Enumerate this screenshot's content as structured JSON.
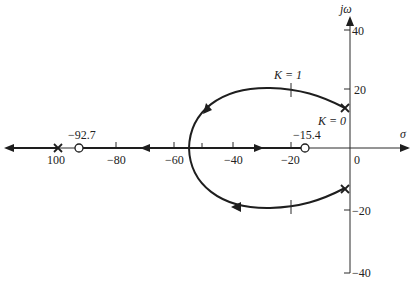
{
  "diagram": {
    "type": "root-locus",
    "axes": {
      "real_label": "σ",
      "imag_label": "jω",
      "real_ticks": [
        "100",
        "−80",
        "−60",
        "−40",
        "−20",
        "0"
      ],
      "imag_ticks": [
        "40",
        "20",
        "−20",
        "−40"
      ]
    },
    "poles": [
      {
        "label": "K = 0",
        "sigma": -2,
        "omega": 13
      },
      {
        "sigma": -2,
        "omega": -13
      },
      {
        "sigma": -100,
        "omega": 0
      }
    ],
    "zeros": [
      {
        "label": "−92.7",
        "sigma": -92.7,
        "omega": 0
      },
      {
        "label": "−15.4",
        "sigma": -15.4,
        "omega": 0
      }
    ],
    "gain_marker": {
      "label": "K = 1",
      "sigma": -20,
      "omega": 20
    },
    "breakaway_sigma": -55,
    "colors": {
      "line": "#1e1e1e",
      "background": "#ffffff"
    }
  }
}
